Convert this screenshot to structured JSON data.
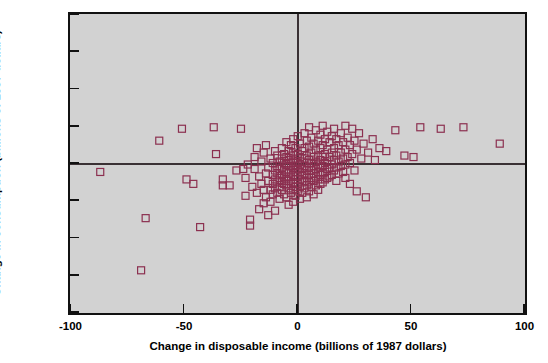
{
  "chart_data": {
    "type": "scatter",
    "title": "",
    "xlabel": "Change in disposable income (billions of 1987 dollars)",
    "ylabel": "Change  in consumption (billions of 1987 dollars)",
    "xlim": [
      -100,
      100
    ],
    "ylim": [
      -100,
      100
    ],
    "xticks": [
      -100,
      -50,
      0,
      50,
      100
    ],
    "yticks": [
      -100,
      -75,
      -50,
      -25,
      0,
      25,
      50,
      75,
      100
    ],
    "xticklabels": [
      "-100",
      "-50",
      "0",
      "50",
      "100"
    ],
    "yticklabels": [
      "-100",
      "-75",
      "-50",
      "-25",
      "0",
      "25",
      "50",
      "75",
      "100"
    ],
    "grid": false,
    "legend": null,
    "reference_lines": [
      {
        "axis": "horizontal",
        "value": 0
      },
      {
        "axis": "vertical",
        "value": 0
      }
    ],
    "marker": {
      "shape": "square",
      "filled": false,
      "edge_color": "#8c3050",
      "size_px": 7
    },
    "plot_background": "#d2d2d2",
    "figure_background": "#ffffff",
    "frame_color": "#111111",
    "points": [
      [
        -88,
        -4
      ],
      [
        -70,
        -70
      ],
      [
        -68,
        -35
      ],
      [
        -62,
        17
      ],
      [
        -52,
        25
      ],
      [
        -50,
        -9
      ],
      [
        -47,
        -12
      ],
      [
        -44,
        -41
      ],
      [
        -38,
        26
      ],
      [
        -37,
        8
      ],
      [
        -34,
        -9
      ],
      [
        -34,
        -13
      ],
      [
        -31,
        -13
      ],
      [
        -28,
        -3
      ],
      [
        -26,
        25
      ],
      [
        -25,
        -2
      ],
      [
        -24,
        -8
      ],
      [
        -24,
        -20
      ],
      [
        -23,
        1
      ],
      [
        -22,
        -40
      ],
      [
        -22,
        -36
      ],
      [
        -21,
        -14
      ],
      [
        -20,
        -2
      ],
      [
        -20,
        6
      ],
      [
        -19,
        -18
      ],
      [
        -19,
        12
      ],
      [
        -18,
        -7
      ],
      [
        -18,
        -29
      ],
      [
        -17,
        3
      ],
      [
        -17,
        -12
      ],
      [
        -16,
        -25
      ],
      [
        -16,
        9
      ],
      [
        -16,
        -16
      ],
      [
        -15,
        -5
      ],
      [
        -15,
        -21
      ],
      [
        -15,
        14
      ],
      [
        -14,
        -1
      ],
      [
        -14,
        -10
      ],
      [
        -14,
        -33
      ],
      [
        -13,
        5
      ],
      [
        -13,
        -16
      ],
      [
        -13,
        -24
      ],
      [
        -12,
        2
      ],
      [
        -12,
        -6
      ],
      [
        -12,
        -12
      ],
      [
        -12,
        -19
      ],
      [
        -11,
        10
      ],
      [
        -11,
        -3
      ],
      [
        -11,
        -9
      ],
      [
        -11,
        -15
      ],
      [
        -11,
        -30
      ],
      [
        -10,
        0
      ],
      [
        -10,
        -5
      ],
      [
        -10,
        -11
      ],
      [
        -10,
        -18
      ],
      [
        -10,
        7
      ],
      [
        -9,
        3
      ],
      [
        -9,
        -2
      ],
      [
        -9,
        -8
      ],
      [
        -9,
        -14
      ],
      [
        -9,
        -22
      ],
      [
        -8,
        12
      ],
      [
        -8,
        5
      ],
      [
        -8,
        -1
      ],
      [
        -8,
        -6
      ],
      [
        -8,
        -10
      ],
      [
        -8,
        -16
      ],
      [
        -7,
        8
      ],
      [
        -7,
        2
      ],
      [
        -7,
        -3
      ],
      [
        -7,
        -7
      ],
      [
        -7,
        -12
      ],
      [
        -7,
        -19
      ],
      [
        -6,
        16
      ],
      [
        -6,
        6
      ],
      [
        -6,
        1
      ],
      [
        -6,
        -4
      ],
      [
        -6,
        -9
      ],
      [
        -6,
        -13
      ],
      [
        -6,
        -21
      ],
      [
        -5,
        10
      ],
      [
        -5,
        4
      ],
      [
        -5,
        0
      ],
      [
        -5,
        -5
      ],
      [
        -5,
        -10
      ],
      [
        -5,
        -15
      ],
      [
        -5,
        -26
      ],
      [
        -4,
        14
      ],
      [
        -4,
        7
      ],
      [
        -4,
        2
      ],
      [
        -4,
        -3
      ],
      [
        -4,
        -7
      ],
      [
        -4,
        -12
      ],
      [
        -4,
        -18
      ],
      [
        -3,
        18
      ],
      [
        -3,
        9
      ],
      [
        -3,
        3
      ],
      [
        -3,
        -1
      ],
      [
        -3,
        -6
      ],
      [
        -3,
        -11
      ],
      [
        -3,
        -16
      ],
      [
        -3,
        -24
      ],
      [
        -2,
        12
      ],
      [
        -2,
        5
      ],
      [
        -2,
        0
      ],
      [
        -2,
        -4
      ],
      [
        -2,
        -9
      ],
      [
        -2,
        -14
      ],
      [
        -2,
        -20
      ],
      [
        -1,
        20
      ],
      [
        -1,
        8
      ],
      [
        -1,
        2
      ],
      [
        -1,
        -2
      ],
      [
        -1,
        -7
      ],
      [
        -1,
        -12
      ],
      [
        -1,
        -17
      ],
      [
        0,
        15
      ],
      [
        0,
        6
      ],
      [
        0,
        1
      ],
      [
        0,
        -4
      ],
      [
        0,
        -9
      ],
      [
        0,
        -14
      ],
      [
        0,
        -22
      ],
      [
        1,
        10
      ],
      [
        1,
        3
      ],
      [
        1,
        -2
      ],
      [
        1,
        -6
      ],
      [
        1,
        -11
      ],
      [
        1,
        -18
      ],
      [
        2,
        22
      ],
      [
        2,
        12
      ],
      [
        2,
        5
      ],
      [
        2,
        0
      ],
      [
        2,
        -5
      ],
      [
        2,
        -10
      ],
      [
        2,
        -15
      ],
      [
        3,
        17
      ],
      [
        3,
        7
      ],
      [
        3,
        2
      ],
      [
        3,
        -3
      ],
      [
        3,
        -8
      ],
      [
        3,
        -13
      ],
      [
        3,
        -21
      ],
      [
        4,
        26
      ],
      [
        4,
        13
      ],
      [
        4,
        4
      ],
      [
        4,
        -1
      ],
      [
        4,
        -6
      ],
      [
        4,
        -11
      ],
      [
        4,
        -17
      ],
      [
        5,
        19
      ],
      [
        5,
        9
      ],
      [
        5,
        2
      ],
      [
        5,
        -3
      ],
      [
        5,
        -8
      ],
      [
        5,
        -14
      ],
      [
        6,
        15
      ],
      [
        6,
        6
      ],
      [
        6,
        0
      ],
      [
        6,
        -5
      ],
      [
        6,
        -10
      ],
      [
        6,
        -19
      ],
      [
        7,
        24
      ],
      [
        7,
        11
      ],
      [
        7,
        3
      ],
      [
        7,
        -2
      ],
      [
        7,
        -7
      ],
      [
        7,
        -13
      ],
      [
        8,
        17
      ],
      [
        8,
        7
      ],
      [
        8,
        1
      ],
      [
        8,
        -4
      ],
      [
        8,
        -9
      ],
      [
        8,
        -16
      ],
      [
        9,
        21
      ],
      [
        9,
        12
      ],
      [
        9,
        4
      ],
      [
        9,
        -1
      ],
      [
        9,
        -6
      ],
      [
        9,
        -12
      ],
      [
        10,
        27
      ],
      [
        10,
        14
      ],
      [
        10,
        6
      ],
      [
        10,
        0
      ],
      [
        10,
        -5
      ],
      [
        10,
        -11
      ],
      [
        11,
        18
      ],
      [
        11,
        8
      ],
      [
        11,
        2
      ],
      [
        11,
        -4
      ],
      [
        11,
        -9
      ],
      [
        12,
        23
      ],
      [
        12,
        11
      ],
      [
        12,
        3
      ],
      [
        12,
        -2
      ],
      [
        12,
        -8
      ],
      [
        13,
        16
      ],
      [
        13,
        6
      ],
      [
        13,
        -1
      ],
      [
        13,
        -7
      ],
      [
        14,
        20
      ],
      [
        14,
        9
      ],
      [
        14,
        1
      ],
      [
        14,
        -6
      ],
      [
        15,
        25
      ],
      [
        15,
        12
      ],
      [
        15,
        4
      ],
      [
        15,
        -3
      ],
      [
        16,
        18
      ],
      [
        16,
        7
      ],
      [
        16,
        -1
      ],
      [
        16,
        -10
      ],
      [
        17,
        14
      ],
      [
        17,
        3
      ],
      [
        17,
        -5
      ],
      [
        18,
        22
      ],
      [
        18,
        9
      ],
      [
        18,
        0
      ],
      [
        19,
        16
      ],
      [
        19,
        5
      ],
      [
        19,
        -4
      ],
      [
        20,
        27
      ],
      [
        20,
        11
      ],
      [
        20,
        1
      ],
      [
        20,
        -8
      ],
      [
        21,
        19
      ],
      [
        21,
        6
      ],
      [
        22,
        14
      ],
      [
        22,
        2
      ],
      [
        22,
        -12
      ],
      [
        23,
        25
      ],
      [
        23,
        8
      ],
      [
        24,
        17
      ],
      [
        24,
        -3
      ],
      [
        25,
        11
      ],
      [
        25,
        -17
      ],
      [
        26,
        22
      ],
      [
        27,
        5
      ],
      [
        28,
        15
      ],
      [
        29,
        -21
      ],
      [
        30,
        9
      ],
      [
        32,
        18
      ],
      [
        33,
        4
      ],
      [
        35,
        12
      ],
      [
        38,
        10
      ],
      [
        42,
        24
      ],
      [
        46,
        7
      ],
      [
        50,
        6
      ],
      [
        53,
        26
      ],
      [
        62,
        25
      ],
      [
        72,
        26
      ],
      [
        88,
        15
      ]
    ]
  }
}
